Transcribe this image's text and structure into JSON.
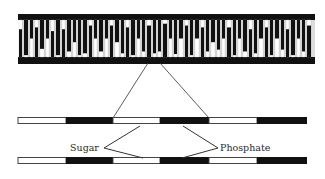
{
  "diagram": {
    "title": "",
    "colors": {
      "ink": "#111111",
      "paper": "#ffffff",
      "line": "#333333"
    },
    "ladder": {
      "x0": 18,
      "x1": 315,
      "top_backbone": {
        "y": 14,
        "h": 6
      },
      "bottom_backbone": {
        "y": 57,
        "h": 7
      },
      "rungs": [
        {
          "x": 19,
          "w": 3,
          "split": 0.25
        },
        {
          "x": 24,
          "w": 4,
          "split": 0.95
        },
        {
          "x": 30,
          "w": 3,
          "split": 0.5
        },
        {
          "x": 35,
          "w": 3,
          "split": 0.2
        },
        {
          "x": 40,
          "w": 4,
          "split": 0.78
        },
        {
          "x": 46,
          "w": 3,
          "split": 0.5
        },
        {
          "x": 51,
          "w": 3,
          "split": 0.3
        },
        {
          "x": 56,
          "w": 4,
          "split": 0.95
        },
        {
          "x": 62,
          "w": 3,
          "split": 0.25
        },
        {
          "x": 67,
          "w": 4,
          "split": 0.85
        },
        {
          "x": 73,
          "w": 3,
          "split": 0.6
        },
        {
          "x": 78,
          "w": 3,
          "split": 0.95
        },
        {
          "x": 83,
          "w": 4,
          "split": 0.9
        },
        {
          "x": 89,
          "w": 3,
          "split": 0.15
        },
        {
          "x": 94,
          "w": 3,
          "split": 0.5
        },
        {
          "x": 99,
          "w": 4,
          "split": 0.85
        },
        {
          "x": 105,
          "w": 3,
          "split": 0.5
        },
        {
          "x": 110,
          "w": 3,
          "split": 0.15
        },
        {
          "x": 115,
          "w": 4,
          "split": 0.6
        },
        {
          "x": 121,
          "w": 3,
          "split": 0.9
        },
        {
          "x": 126,
          "w": 3,
          "split": 0.2
        },
        {
          "x": 131,
          "w": 4,
          "split": 0.95
        },
        {
          "x": 137,
          "w": 3,
          "split": 0.5
        },
        {
          "x": 142,
          "w": 3,
          "split": 0.85
        },
        {
          "x": 147,
          "w": 4,
          "split": 0.15
        },
        {
          "x": 153,
          "w": 3,
          "split": 0.9
        },
        {
          "x": 158,
          "w": 3,
          "split": 0.85
        },
        {
          "x": 163,
          "w": 4,
          "split": 0.1
        },
        {
          "x": 169,
          "w": 3,
          "split": 0.5
        },
        {
          "x": 174,
          "w": 3,
          "split": 0.92
        },
        {
          "x": 179,
          "w": 4,
          "split": 0.5
        },
        {
          "x": 185,
          "w": 3,
          "split": 0.15
        },
        {
          "x": 190,
          "w": 3,
          "split": 0.95
        },
        {
          "x": 195,
          "w": 4,
          "split": 0.5
        },
        {
          "x": 201,
          "w": 3,
          "split": 0.2
        },
        {
          "x": 206,
          "w": 3,
          "split": 0.85
        },
        {
          "x": 211,
          "w": 4,
          "split": 0.6
        },
        {
          "x": 217,
          "w": 3,
          "split": 0.8
        },
        {
          "x": 222,
          "w": 3,
          "split": 0.5
        },
        {
          "x": 227,
          "w": 4,
          "split": 0.2
        },
        {
          "x": 233,
          "w": 3,
          "split": 0.95
        },
        {
          "x": 238,
          "w": 3,
          "split": 0.5
        },
        {
          "x": 243,
          "w": 4,
          "split": 0.85
        },
        {
          "x": 249,
          "w": 3,
          "split": 0.25
        },
        {
          "x": 254,
          "w": 3,
          "split": 0.9
        },
        {
          "x": 259,
          "w": 4,
          "split": 0.5
        },
        {
          "x": 265,
          "w": 3,
          "split": 0.2
        },
        {
          "x": 270,
          "w": 3,
          "split": 0.95
        },
        {
          "x": 275,
          "w": 4,
          "split": 0.5
        },
        {
          "x": 281,
          "w": 3,
          "split": 0.8
        },
        {
          "x": 286,
          "w": 3,
          "split": 0.25
        },
        {
          "x": 291,
          "w": 4,
          "split": 0.95
        },
        {
          "x": 297,
          "w": 3,
          "split": 0.5
        },
        {
          "x": 302,
          "w": 3,
          "split": 0.85
        },
        {
          "x": 307,
          "w": 4,
          "split": 0.15
        }
      ]
    },
    "zoom_lines": [
      {
        "x1": 148,
        "y1": 63,
        "x2": 113,
        "y2": 118
      },
      {
        "x1": 160,
        "y1": 63,
        "x2": 209,
        "y2": 118
      }
    ],
    "strands": [
      {
        "y": 117,
        "h": 7,
        "segments": [
          {
            "x": 18,
            "x2": 66,
            "kind": "sugar"
          },
          {
            "x": 66,
            "x2": 113,
            "kind": "phosphate"
          },
          {
            "x": 113,
            "x2": 160,
            "kind": "sugar"
          },
          {
            "x": 160,
            "x2": 209,
            "kind": "phosphate"
          },
          {
            "x": 209,
            "x2": 257,
            "kind": "sugar"
          },
          {
            "x": 257,
            "x2": 307,
            "kind": "phosphate"
          }
        ]
      },
      {
        "y": 157,
        "h": 7,
        "segments": [
          {
            "x": 18,
            "x2": 66,
            "kind": "sugar"
          },
          {
            "x": 66,
            "x2": 113,
            "kind": "phosphate"
          },
          {
            "x": 113,
            "x2": 160,
            "kind": "sugar"
          },
          {
            "x": 160,
            "x2": 209,
            "kind": "phosphate"
          },
          {
            "x": 209,
            "x2": 257,
            "kind": "sugar"
          },
          {
            "x": 257,
            "x2": 307,
            "kind": "phosphate"
          }
        ]
      }
    ],
    "labels": {
      "sugar": {
        "text": "Sugar",
        "x": 70,
        "y": 151,
        "pointer": {
          "vx": 104,
          "vy": 148,
          "ax": 140,
          "ay": 126,
          "bx": 143,
          "by": 158
        }
      },
      "phosphate": {
        "text": "Phosphate",
        "x": 220,
        "y": 151,
        "pointer": {
          "vx": 218,
          "vy": 148,
          "ax": 183,
          "ay": 126,
          "bx": 182,
          "by": 158
        }
      }
    }
  }
}
